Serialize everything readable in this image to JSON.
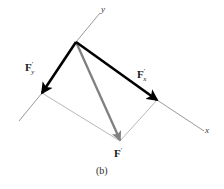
{
  "figure": {
    "caption": "(b)",
    "axes": {
      "y_label": "y",
      "x_label": "x"
    },
    "vectors": [
      {
        "id": "f-y-component",
        "name": "F'y",
        "base": "F",
        "prime": "′",
        "subscript": "y",
        "color": "#000000",
        "style": "bold-solid",
        "from": [
          76,
          42
        ],
        "to": [
          42,
          93
        ]
      },
      {
        "id": "f-x-component",
        "name": "F'x",
        "base": "F",
        "prime": "′",
        "subscript": "x",
        "color": "#000000",
        "style": "bold-solid",
        "from": [
          76,
          42
        ],
        "to": [
          157,
          100
        ]
      },
      {
        "id": "f-resultant",
        "name": "F'",
        "base": "F",
        "prime": "′",
        "subscript": "",
        "color": "#808080",
        "style": "medium-solid",
        "from": [
          76,
          42
        ],
        "to": [
          120,
          140
        ]
      }
    ],
    "construction_lines": [
      {
        "id": "parallel-from-fy",
        "from": [
          42,
          93
        ],
        "to": [
          120,
          141
        ],
        "color": "#b8b8b8"
      },
      {
        "id": "parallel-from-fx",
        "from": [
          157,
          100
        ],
        "to": [
          120,
          141
        ],
        "color": "#b8b8b8"
      }
    ],
    "axis_lines": [
      {
        "id": "y-axis",
        "from": [
          76,
          42
        ],
        "to": [
          100,
          13
        ],
        "color": "#9a9a9a"
      },
      {
        "id": "x-axis-negative",
        "from": [
          42,
          93
        ],
        "to": [
          19,
          121
        ],
        "color": "#9a9a9a"
      },
      {
        "id": "x-axis-positive",
        "from": [
          157,
          100
        ],
        "to": [
          204,
          131
        ],
        "color": "#9a9a9a"
      }
    ],
    "colors": {
      "background": "#ffffff",
      "vector_bold": "#000000",
      "vector_resultant": "#808080",
      "construction": "#b8b8b8",
      "axis": "#9a9a9a",
      "text": "#1a1a1a"
    }
  }
}
